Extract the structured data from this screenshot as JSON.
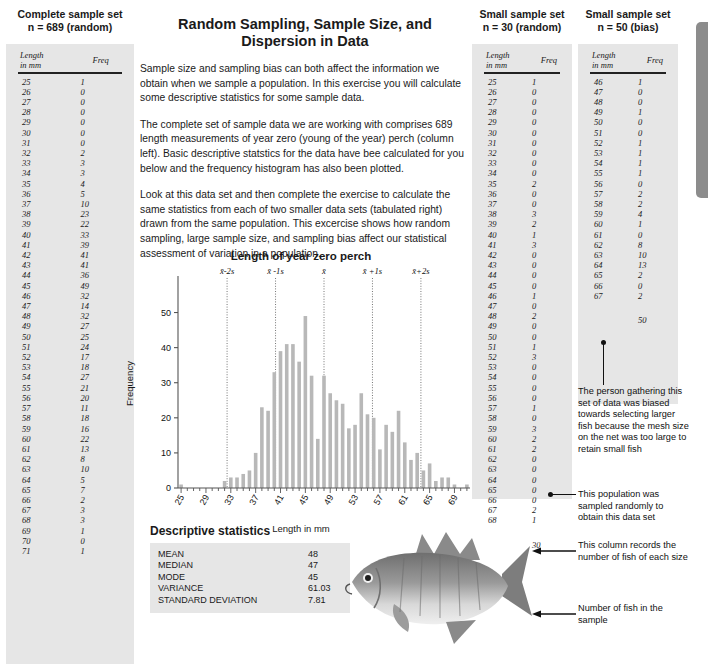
{
  "complete_set": {
    "heading": "Complete sample set",
    "n_label": "n = 689 (random)",
    "columns": {
      "length": "Length\nin mm",
      "length_l1": "Length",
      "length_l2": "in mm",
      "freq": "Freq"
    },
    "rows": [
      [
        25,
        1
      ],
      [
        26,
        0
      ],
      [
        27,
        0
      ],
      [
        28,
        0
      ],
      [
        29,
        0
      ],
      [
        30,
        0
      ],
      [
        31,
        0
      ],
      [
        32,
        2
      ],
      [
        33,
        3
      ],
      [
        34,
        3
      ],
      [
        35,
        4
      ],
      [
        36,
        5
      ],
      [
        37,
        10
      ],
      [
        38,
        23
      ],
      [
        39,
        22
      ],
      [
        40,
        33
      ],
      [
        41,
        39
      ],
      [
        42,
        41
      ],
      [
        43,
        41
      ],
      [
        44,
        36
      ],
      [
        45,
        49
      ],
      [
        46,
        32
      ],
      [
        47,
        14
      ],
      [
        48,
        32
      ],
      [
        49,
        27
      ],
      [
        50,
        25
      ],
      [
        51,
        24
      ],
      [
        52,
        17
      ],
      [
        53,
        18
      ],
      [
        54,
        27
      ],
      [
        55,
        21
      ],
      [
        56,
        20
      ],
      [
        57,
        11
      ],
      [
        58,
        18
      ],
      [
        59,
        16
      ],
      [
        60,
        22
      ],
      [
        61,
        13
      ],
      [
        62,
        8
      ],
      [
        63,
        10
      ],
      [
        64,
        5
      ],
      [
        65,
        7
      ],
      [
        66,
        2
      ],
      [
        67,
        3
      ],
      [
        68,
        3
      ],
      [
        69,
        1
      ],
      [
        70,
        0
      ],
      [
        71,
        1
      ]
    ]
  },
  "small_random": {
    "heading": "Small sample set",
    "n_label": "n = 30 (random)",
    "columns": {
      "length_l1": "Length",
      "length_l2": "in mm",
      "freq": "Freq"
    },
    "rows": [
      [
        25,
        1
      ],
      [
        26,
        0
      ],
      [
        27,
        0
      ],
      [
        28,
        0
      ],
      [
        29,
        0
      ],
      [
        30,
        0
      ],
      [
        31,
        0
      ],
      [
        32,
        0
      ],
      [
        33,
        0
      ],
      [
        34,
        0
      ],
      [
        35,
        2
      ],
      [
        36,
        0
      ],
      [
        37,
        0
      ],
      [
        38,
        3
      ],
      [
        39,
        2
      ],
      [
        40,
        1
      ],
      [
        41,
        3
      ],
      [
        42,
        0
      ],
      [
        43,
        0
      ],
      [
        44,
        0
      ],
      [
        45,
        0
      ],
      [
        46,
        1
      ],
      [
        47,
        0
      ],
      [
        48,
        2
      ],
      [
        49,
        0
      ],
      [
        50,
        0
      ],
      [
        51,
        1
      ],
      [
        52,
        3
      ],
      [
        53,
        0
      ],
      [
        54,
        0
      ],
      [
        55,
        0
      ],
      [
        56,
        0
      ],
      [
        57,
        1
      ],
      [
        58,
        0
      ],
      [
        59,
        3
      ],
      [
        60,
        2
      ],
      [
        61,
        2
      ],
      [
        62,
        0
      ],
      [
        63,
        0
      ],
      [
        64,
        0
      ],
      [
        65,
        0
      ],
      [
        66,
        0
      ],
      [
        67,
        2
      ],
      [
        68,
        1
      ]
    ],
    "total": "30"
  },
  "small_bias": {
    "heading": "Small sample set",
    "n_label": "n = 50 (bias)",
    "columns": {
      "length_l1": "Length",
      "length_l2": "in mm",
      "freq": "Freq"
    },
    "rows": [
      [
        46,
        1
      ],
      [
        47,
        0
      ],
      [
        48,
        0
      ],
      [
        49,
        1
      ],
      [
        50,
        0
      ],
      [
        51,
        0
      ],
      [
        52,
        1
      ],
      [
        53,
        1
      ],
      [
        54,
        1
      ],
      [
        55,
        1
      ],
      [
        56,
        0
      ],
      [
        57,
        2
      ],
      [
        58,
        2
      ],
      [
        59,
        4
      ],
      [
        60,
        1
      ],
      [
        61,
        0
      ],
      [
        62,
        8
      ],
      [
        63,
        10
      ],
      [
        64,
        13
      ],
      [
        65,
        2
      ],
      [
        66,
        0
      ],
      [
        67,
        2
      ]
    ],
    "total": "50"
  },
  "main": {
    "title_line1": "Random Sampling, Sample Size, and",
    "title_line2": "Dispersion in Data",
    "para1": "Sample size and sampling bias can both affect the information we obtain when we sample a population. In this exercise you will calculate some descriptive statistics for some sample data.",
    "para2": "The complete set of sample data we are working with comprises 689 length measurements of year zero (young of the year) perch (column left). Basic descriptive statstics for the data have bee calculated for you below and the frequency histogram has also been plotted.",
    "para3": "Look at this data set and then complete the exercise to calculate the same statistics from each of two smaller data sets (tabulated right) drawn from the same population. This excercise shows how random sampling, large sample size, and sampling bias affect our statistical assessment of variation in a population."
  },
  "descriptive": {
    "heading": "Descriptive statistics",
    "rows": [
      {
        "label": "MEAN",
        "value": "48"
      },
      {
        "label": "MEDIAN",
        "value": "47"
      },
      {
        "label": "MODE",
        "value": "45"
      },
      {
        "label": "VARIANCE",
        "value": "61.03"
      },
      {
        "label": "STANDARD DEVIATION",
        "value": "7.81"
      }
    ]
  },
  "annotations": {
    "bias_note": "The person gathering this set of data was biased towards selecting larger fish because the mesh size on the net was too large to retain small fish",
    "random_note": "This population was sampled randomly to obtain this data set",
    "column_note": "This column records the number of fish of each size",
    "total_note": "Number of fish in the sample"
  },
  "chart_data": {
    "type": "bar",
    "title": "Length of year zero perch",
    "xlabel": "Length in mm",
    "ylabel": "Frequency",
    "xlim": [
      24.5,
      71.5
    ],
    "ylim": [
      0,
      53
    ],
    "yticks": [
      0,
      10,
      20,
      30,
      40,
      50
    ],
    "xticks": [
      25,
      29,
      33,
      37,
      41,
      45,
      49,
      53,
      57,
      61,
      65,
      69
    ],
    "xtick_minor_step": 1,
    "grid": false,
    "legend": "none",
    "bar_color": "#b8b8b8",
    "categories": [
      25,
      26,
      27,
      28,
      29,
      30,
      31,
      32,
      33,
      34,
      35,
      36,
      37,
      38,
      39,
      40,
      41,
      42,
      43,
      44,
      45,
      46,
      47,
      48,
      49,
      50,
      51,
      52,
      53,
      54,
      55,
      56,
      57,
      58,
      59,
      60,
      61,
      62,
      63,
      64,
      65,
      66,
      67,
      68,
      69,
      70,
      71
    ],
    "values": [
      1,
      0,
      0,
      0,
      0,
      0,
      0,
      2,
      3,
      3,
      4,
      5,
      10,
      23,
      22,
      33,
      39,
      41,
      41,
      36,
      49,
      32,
      14,
      32,
      27,
      25,
      24,
      17,
      18,
      27,
      21,
      20,
      11,
      18,
      16,
      22,
      13,
      8,
      10,
      5,
      7,
      2,
      3,
      3,
      1,
      0,
      1
    ],
    "annotation_lines": [
      {
        "label": "x̄-2s",
        "x": 32.4
      },
      {
        "label": "x̄ -1s",
        "x": 40.2
      },
      {
        "label": "x̄",
        "x": 48.0
      },
      {
        "label": "x̄ +1s",
        "x": 55.8
      },
      {
        "label": "x̄+2s",
        "x": 63.6
      }
    ]
  }
}
